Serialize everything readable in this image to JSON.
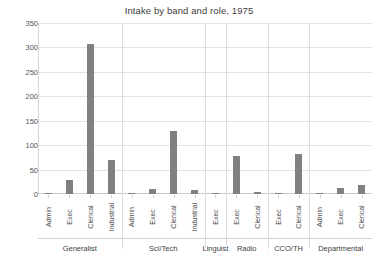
{
  "chart_data": {
    "type": "bar",
    "title": "Intake by band and role, 1975",
    "xlabel": "",
    "ylabel": "",
    "ylim": [
      0,
      350
    ],
    "ytick_step": 50,
    "yticks": [
      "350",
      "300",
      "250",
      "200",
      "150",
      "100",
      "50",
      "0"
    ],
    "grid": true,
    "legend": "none",
    "bar_color": "#808080",
    "groups": [
      {
        "band": "Generalist",
        "categories": [
          "Admin",
          "Exec",
          "Clerical",
          "Industrial"
        ],
        "values": [
          3,
          28,
          307,
          69
        ]
      },
      {
        "band": "Sci/Tech",
        "categories": [
          "Admin",
          "Exec",
          "Clerical",
          "Industrial"
        ],
        "values": [
          1,
          11,
          130,
          8
        ]
      },
      {
        "band": "Linguist",
        "categories": [
          "Exec"
        ],
        "values": [
          2
        ]
      },
      {
        "band": "Radio",
        "categories": [
          "Exec",
          "Clerical"
        ],
        "values": [
          78,
          4
        ]
      },
      {
        "band": "CCO/TH",
        "categories": [
          "Exec",
          "Clerical"
        ],
        "values": [
          2,
          82
        ]
      },
      {
        "band": "Departmental",
        "categories": [
          "Admin",
          "Exec",
          "Clerical"
        ],
        "values": [
          2,
          12,
          18
        ]
      }
    ]
  }
}
